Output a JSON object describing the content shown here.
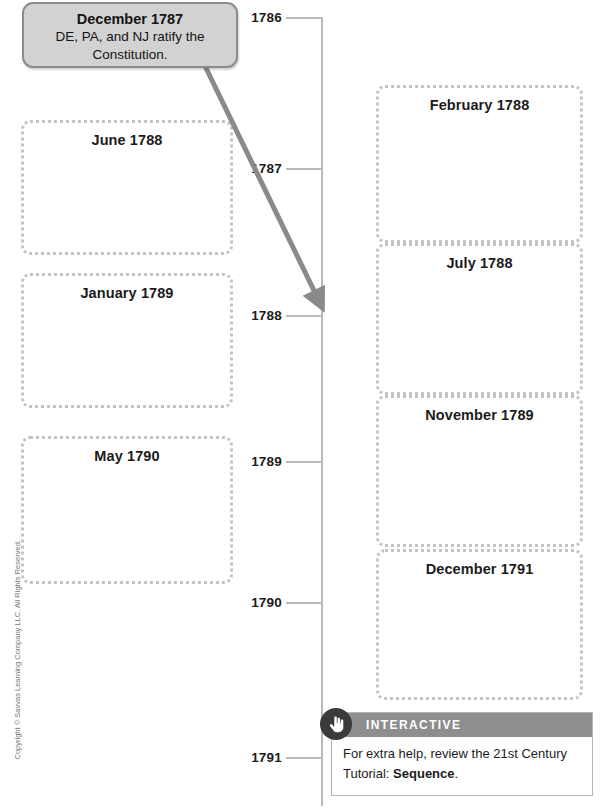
{
  "callout": {
    "title": "December 1787",
    "line1": "DE, PA, and NJ ratify the",
    "line2": "Constitution."
  },
  "timeline": {
    "years": [
      {
        "label": "1786",
        "y": 17
      },
      {
        "label": "1787",
        "y": 168
      },
      {
        "label": "1788",
        "y": 315
      },
      {
        "label": "1789",
        "y": 461
      },
      {
        "label": "1790",
        "y": 602
      },
      {
        "label": "1791",
        "y": 757
      }
    ]
  },
  "left_boxes": [
    {
      "label": "June 1788"
    },
    {
      "label": "January 1789"
    },
    {
      "label": "May 1790"
    }
  ],
  "right_boxes": [
    {
      "label": "February 1788"
    },
    {
      "label": "July 1788"
    },
    {
      "label": "November 1789"
    },
    {
      "label": "December 1791"
    }
  ],
  "interactive": {
    "header": "INTERACTIVE",
    "icon": "hand-pointer-icon",
    "body_part1": "For extra help, review the 21st Century",
    "body_part2": "Tutorial: ",
    "body_bold": "Sequence",
    "body_part3": "."
  },
  "copyright": "Copyright © Savvas Learning Company LLC. All Rights Reserved.",
  "colors": {
    "axis": "#b9b9b9",
    "dotted_border": "#c4c4c4",
    "callout_fill": "#d2d2d2",
    "callout_stroke": "#8c8c8c",
    "arrow": "#8a8a8a",
    "interactive_header": "#8e8e8e",
    "badge": "#3a3a3a",
    "text": "#1b1b1b"
  }
}
